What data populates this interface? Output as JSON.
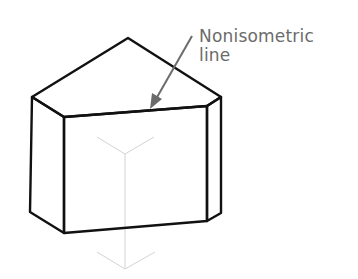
{
  "annotation": {
    "line1": "Nonisometric",
    "line2": "line"
  },
  "colors": {
    "outline": "#111111",
    "axes": "#cfcfcf",
    "annotation": "#6b6b6b"
  }
}
